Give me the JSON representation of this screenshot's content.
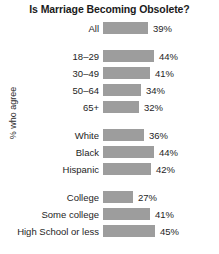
{
  "chart_data": {
    "type": "bar",
    "title": "Is Marriage Becoming Obsolete?",
    "xlabel": "",
    "ylabel": "% who agree",
    "orientation": "horizontal",
    "grid": false,
    "legend": null,
    "value_suffix": "%",
    "xlim": [
      0,
      50
    ],
    "bar_color": "#9d9d9d",
    "background_color": "#ffffff",
    "text_color": "#1e1e1e",
    "categories": [
      "All",
      "18–29",
      "30–49",
      "50–64",
      "65+",
      "White",
      "Black",
      "Hispanic",
      "College",
      "Some college",
      "High School or less"
    ],
    "values": [
      39,
      44,
      41,
      34,
      32,
      36,
      44,
      42,
      27,
      41,
      45
    ],
    "groups": [
      {
        "name": "overall",
        "rows": [
          {
            "label": "All",
            "value": 39,
            "value_label": "39%"
          }
        ]
      },
      {
        "name": "age",
        "rows": [
          {
            "label": "18–29",
            "value": 44,
            "value_label": "44%"
          },
          {
            "label": "30–49",
            "value": 41,
            "value_label": "41%"
          },
          {
            "label": "50–64",
            "value": 34,
            "value_label": "34%"
          },
          {
            "label": "65+",
            "value": 32,
            "value_label": "32%"
          }
        ]
      },
      {
        "name": "race-ethnicity",
        "rows": [
          {
            "label": "White",
            "value": 36,
            "value_label": "36%"
          },
          {
            "label": "Black",
            "value": 44,
            "value_label": "44%"
          },
          {
            "label": "Hispanic",
            "value": 42,
            "value_label": "42%"
          }
        ]
      },
      {
        "name": "education",
        "rows": [
          {
            "label": "College",
            "value": 27,
            "value_label": "27%"
          },
          {
            "label": "Some college",
            "value": 41,
            "value_label": "41%"
          },
          {
            "label": "High School or less",
            "value": 45,
            "value_label": "45%"
          }
        ]
      }
    ]
  }
}
